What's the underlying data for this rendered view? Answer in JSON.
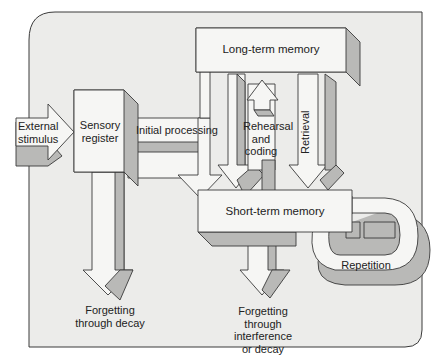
{
  "diagram": {
    "title": "",
    "type": "memory-model flow diagram",
    "colors": {
      "background_panel": "#ececea",
      "box_fill": "#f6f6f4",
      "shadow_fill": "#b9b9b7",
      "stroke": "#3a3a3a"
    },
    "nodes": {
      "external_stimulus": "External\nstimulus",
      "sensory_register": "Sensory\nregister",
      "long_term_memory": "Long-term memory",
      "short_term_memory": "Short-term memory"
    },
    "edges": {
      "initial_processing": "Initial processing",
      "rehearsal_coding": "Rehearsal\nand\ncoding",
      "retrieval": "Retrieval",
      "repetition": "Repetition",
      "forgetting_decay": "Forgetting\nthrough decay",
      "forgetting_interference": "Forgetting\nthrough\ninterference\nor decay"
    },
    "labels": {
      "external_1": "External",
      "external_2": "stimulus",
      "sensory_1": "Sensory",
      "sensory_2": "register",
      "ltm": "Long-term memory",
      "stm": "Short-term memory",
      "initial": "Initial processing",
      "rehearsal_1": "Rehearsal",
      "rehearsal_2": "and",
      "rehearsal_3": "coding",
      "retrieval": "Retrieval",
      "repetition": "Repetition",
      "fd_1": "Forgetting",
      "fd_2": "through decay",
      "fi_1": "Forgetting",
      "fi_2": "through",
      "fi_3": "interference",
      "fi_4": "or decay"
    }
  }
}
